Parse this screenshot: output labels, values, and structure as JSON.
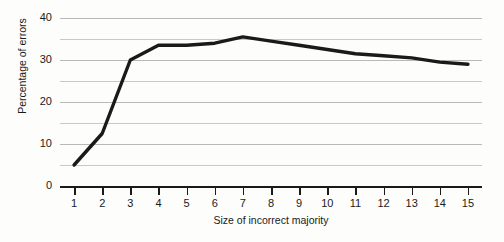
{
  "chart_data": {
    "type": "line",
    "title": "",
    "subtitle": "",
    "xlabel": "Size of incorrect majority",
    "ylabel": "Percentage of errors",
    "x": [
      1,
      2,
      3,
      4,
      5,
      6,
      7,
      8,
      9,
      10,
      11,
      12,
      13,
      14,
      15
    ],
    "values": [
      5,
      12.5,
      30,
      33.5,
      33.5,
      34,
      35.5,
      34.5,
      33.5,
      32.5,
      31.5,
      31,
      30.5,
      29.5,
      29
    ],
    "series": [
      {
        "name": "Percentage of errors",
        "values": [
          5,
          12.5,
          30,
          33.5,
          33.5,
          34,
          35.5,
          34.5,
          33.5,
          32.5,
          31.5,
          31,
          30.5,
          29.5,
          29
        ]
      }
    ],
    "xlim": [
      0.5,
      15.5
    ],
    "ylim": [
      0,
      42
    ],
    "x_tick_labels": [
      "1",
      "2",
      "3",
      "4",
      "5",
      "6",
      "7",
      "8",
      "9",
      "10",
      "11",
      "12",
      "13",
      "14",
      "15"
    ],
    "y_tick_labels": [
      "0",
      "10",
      "20",
      "30",
      "40"
    ],
    "y_tick_values": [
      0,
      10,
      20,
      30,
      40
    ],
    "y_minor_gridlines": [
      5,
      15,
      25,
      35,
      40
    ],
    "grid": "horizontal",
    "legend": "none",
    "line_color": "#1a1a1a",
    "grid_color": "#b9b9b9",
    "background": "#fdfdfc"
  }
}
